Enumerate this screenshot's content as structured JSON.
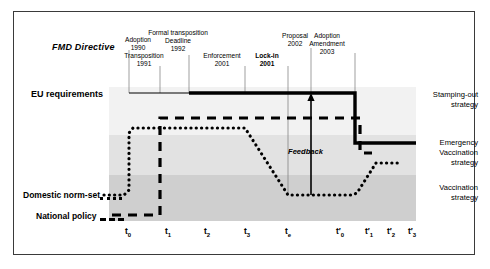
{
  "figure": {
    "title_axis_left": [
      {
        "id": "fmd-directive",
        "text": "FMD Directive"
      },
      {
        "id": "eu-requirements",
        "text": "EU requirements"
      },
      {
        "id": "domestic-norm-set",
        "text": "Domestic norm-set"
      },
      {
        "id": "national-policy",
        "text": "National policy"
      }
    ],
    "feedback_label": "Feedback"
  },
  "annotations": [
    {
      "id": "adoption-1990",
      "line1": "Adoption",
      "line2": "1990",
      "bold": false,
      "x": 138,
      "y": 36,
      "tip_x": 129,
      "tip_y": 93
    },
    {
      "id": "transposition-1991",
      "line1": "Transposition",
      "line2": "1991",
      "bold": false,
      "x": 144,
      "y": 52,
      "tip_x": 160,
      "tip_y": 93
    },
    {
      "id": "formal-transposition-deadline-1992",
      "line1": "Formal transposition",
      "line2": "Deadline",
      "line3": "1992",
      "bold": false,
      "x": 178,
      "y": 29,
      "tip_x": 189,
      "tip_y": 93
    },
    {
      "id": "enforcement-2001",
      "line1": "Enforcement",
      "line2": "2001",
      "bold": false,
      "x": 222,
      "y": 52,
      "tip_x": 245,
      "tip_y": 93
    },
    {
      "id": "lock-in-2001",
      "line1": "Lock-in",
      "line2": "2001",
      "bold": true,
      "x": 267,
      "y": 52,
      "tip_x": 288,
      "tip_y": 93
    },
    {
      "id": "proposal-2002",
      "line1": "Proposal",
      "line2": "2002",
      "bold": false,
      "x": 295,
      "y": 32,
      "tip_x": 311,
      "tip_y": 93
    },
    {
      "id": "adoption-amendment-2003",
      "line1": "Adoption",
      "line2": "Amendment",
      "line3": "2003",
      "bold": false,
      "x": 327,
      "y": 32,
      "tip_x": 355,
      "tip_y": 93
    }
  ],
  "strategy_bands": [
    {
      "id": "stamping-out",
      "line1": "Stamping-out",
      "line2": "strategy",
      "color": "#f2f2f2"
    },
    {
      "id": "emergency-vaccination",
      "line1": "Emergency",
      "line2": "Vaccination",
      "line3": "strategy",
      "color": "#e2e2e2"
    },
    {
      "id": "vaccination",
      "line1": "Vaccination",
      "line2": "strategy",
      "color": "#cfcfcf"
    }
  ],
  "x_ticks": [
    {
      "id": "t0",
      "base": "t",
      "sub": "0",
      "prime": false,
      "x": 128
    },
    {
      "id": "t1",
      "base": "t",
      "sub": "1",
      "prime": false,
      "x": 168
    },
    {
      "id": "t2",
      "base": "t",
      "sub": "2",
      "prime": false,
      "x": 207
    },
    {
      "id": "t3",
      "base": "t",
      "sub": "3",
      "prime": false,
      "x": 247
    },
    {
      "id": "te",
      "base": "t",
      "sub": "e",
      "prime": false,
      "x": 288
    },
    {
      "id": "tp0",
      "base": "t",
      "sub": "0",
      "prime": true,
      "x": 340
    },
    {
      "id": "tp1",
      "base": "t",
      "sub": "1",
      "prime": true,
      "x": 369
    },
    {
      "id": "tp2",
      "base": "t",
      "sub": "2",
      "prime": true,
      "x": 391
    },
    {
      "id": "tp3",
      "base": "t",
      "sub": "3",
      "prime": true,
      "x": 412
    }
  ],
  "chart_data": {
    "type": "line",
    "title": "",
    "xlabel": "",
    "ylabel": "",
    "x_categories": [
      "t0",
      "t1",
      "t2",
      "t3",
      "te",
      "t'0",
      "t'1",
      "t'2",
      "t'3"
    ],
    "y_levels": {
      "eu_requirements": 93,
      "national_policy_high": 118,
      "domestic_norm_high": 128,
      "emergency_upper": 143,
      "emergency_lower": 153,
      "domestic_recover": 162,
      "domestic_norm_low": 195,
      "national_policy_low": 215
    },
    "series": [
      {
        "name": "EU requirements (FMD Directive)",
        "style": "solid",
        "description": "Thin solid from t0 to formal transposition deadline, then thick solid at EU-requirements level until t'0, then drops to Emergency Vaccination band and continues right.",
        "points": [
          [
            129,
            93
          ],
          [
            189,
            93
          ],
          [
            355,
            93
          ],
          [
            355,
            143
          ],
          [
            416,
            143
          ]
        ]
      },
      {
        "name": "National policy",
        "style": "dashed",
        "description": "Low until t1, steps up to just under EU requirements, runs flat to t'0, then drops into Emergency Vaccination band.",
        "points": [
          [
            112,
            215
          ],
          [
            160,
            215
          ],
          [
            160,
            118
          ],
          [
            360,
            118
          ],
          [
            360,
            153
          ],
          [
            372,
            153
          ]
        ]
      },
      {
        "name": "Domestic norm-set",
        "style": "dotted",
        "description": "Low until t0, rises to near EU level, flat through t3, falls diagonally to low level at te, flat to t'0, then rises into Emergency Vaccination band.",
        "points": [
          [
            104,
            195
          ],
          [
            124,
            195
          ],
          [
            129,
            128
          ],
          [
            245,
            128
          ],
          [
            288,
            195
          ],
          [
            352,
            195
          ],
          [
            376,
            162
          ],
          [
            398,
            162
          ]
        ]
      }
    ],
    "annotations": [
      {
        "label": "Feedback",
        "type": "arrow-up",
        "x": 311,
        "y_from": 195,
        "y_to": 95
      }
    ],
    "bands": [
      {
        "label": "Stamping-out strategy",
        "y_from": 87,
        "y_to": 135
      },
      {
        "label": "Emergency Vaccination strategy",
        "y_from": 135,
        "y_to": 175
      },
      {
        "label": "Vaccination strategy",
        "y_from": 175,
        "y_to": 221
      }
    ],
    "grid": false,
    "legend_position": "left-axis-labels"
  }
}
